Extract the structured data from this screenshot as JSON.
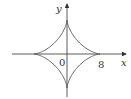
{
  "diagram": {
    "type": "astroid curve",
    "axes": {
      "x_label": "x",
      "y_label": "y"
    },
    "labels": {
      "origin": "0",
      "x_intercept": "8"
    },
    "colors": {
      "axis": "#333333",
      "curve": "#555555",
      "background": "#ffffff"
    }
  }
}
